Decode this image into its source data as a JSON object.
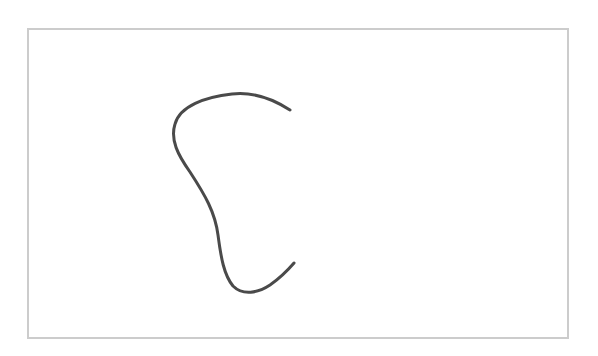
{
  "canvas": {
    "border_color": "#cccccc",
    "background": "#ffffff"
  },
  "stroke": {
    "color": "#4a4a4a",
    "width": 3,
    "points": [
      [
        290,
        110
      ],
      [
        235,
        93
      ],
      [
        175,
        115
      ],
      [
        182,
        155
      ],
      [
        216,
        210
      ],
      [
        224,
        262
      ],
      [
        248,
        292
      ],
      [
        294,
        263
      ]
    ],
    "path": "M 290 110 C 270 97, 250 92, 232 94 C 205 97, 180 106, 175 124 C 170 140, 178 155, 190 172 C 205 195, 215 212, 218 235 C 221 258, 224 275, 233 286 C 243 296, 258 293, 270 285 C 280 278, 288 270, 294 263"
  }
}
